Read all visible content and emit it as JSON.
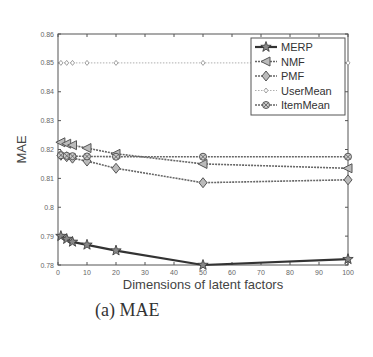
{
  "chart_data": {
    "type": "line",
    "title": "",
    "caption": "(a) MAE",
    "xlabel": "Dimensions of latent factors",
    "ylabel": "MAE",
    "xlim": [
      0,
      100
    ],
    "ylim": [
      0.78,
      0.86
    ],
    "xticks": [
      0,
      10,
      20,
      30,
      40,
      50,
      60,
      70,
      80,
      90,
      100
    ],
    "yticks": [
      0.78,
      0.79,
      0.8,
      0.81,
      0.82,
      0.83,
      0.84,
      0.85,
      0.86
    ],
    "ytick_labels": [
      "0.78",
      "0.79",
      "0.8",
      "0.81",
      "0.82",
      "0.83",
      "0.84",
      "0.85",
      "0.86"
    ],
    "grid": false,
    "legend_position": "upper right",
    "x": [
      1,
      3,
      5,
      10,
      20,
      50,
      100
    ],
    "series": [
      {
        "name": "MERP",
        "marker": "star",
        "values": [
          0.79,
          0.789,
          0.788,
          0.787,
          0.785,
          0.78,
          0.782
        ]
      },
      {
        "name": "NMF",
        "marker": "left-triangle",
        "values": [
          0.8225,
          0.822,
          0.8215,
          0.8205,
          0.8185,
          0.815,
          0.8135
        ]
      },
      {
        "name": "PMF",
        "marker": "diamond",
        "values": [
          0.818,
          0.8175,
          0.817,
          0.816,
          0.8135,
          0.8085,
          0.8095
        ]
      },
      {
        "name": "UserMean",
        "marker": "small-diamond",
        "values": [
          0.85,
          0.85,
          0.85,
          0.85,
          0.85,
          0.85,
          0.85
        ]
      },
      {
        "name": "ItemMean",
        "marker": "circle-x",
        "values": [
          0.818,
          0.8178,
          0.8177,
          0.8176,
          0.8175,
          0.8175,
          0.8175
        ]
      }
    ]
  }
}
